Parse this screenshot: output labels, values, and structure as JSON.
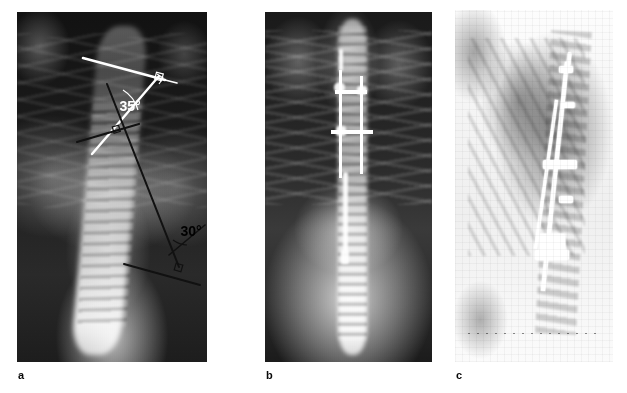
{
  "figure": {
    "kind": "radiograph-figure",
    "panel_count": 3,
    "background_color": "#ffffff"
  },
  "panels": [
    {
      "label": "a",
      "name": "preoperative-ap-spine-radiograph",
      "view": "anteroposterior",
      "description": "Preoperative standing AP radiograph of the thoracolumbar spine showing a double scoliotic curve with Cobb angle construction lines drawn.",
      "annotations": [
        {
          "name": "upper-cobb-angle",
          "text": "35°",
          "value": 35,
          "unit": "degrees",
          "color": "#ffffff",
          "curve": "upper thoracic"
        },
        {
          "name": "lower-cobb-angle",
          "text": "30°",
          "value": 30,
          "unit": "degrees",
          "color": "#000000",
          "curve": "lower lumbar"
        }
      ]
    },
    {
      "label": "b",
      "name": "postoperative-ap-spine-radiograph",
      "view": "anteroposterior",
      "description": "Postoperative AP radiograph showing posterior spinal instrumentation with rods and transverse cross-connectors.",
      "annotations": []
    },
    {
      "label": "c",
      "name": "postoperative-lateral-spine-radiograph",
      "view": "lateral",
      "description": "Postoperative lateral radiograph demonstrating the posterior rod-and-hook construct along the thoracolumbar spine.",
      "annotations": []
    }
  ],
  "colors": {
    "annotation_white": "#ffffff",
    "annotation_black": "#000000",
    "label_text": "#0a0a0a",
    "page_background": "#ffffff"
  }
}
